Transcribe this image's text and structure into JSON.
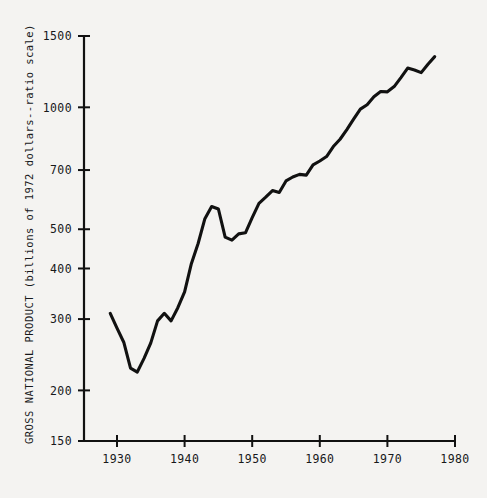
{
  "chart_data": {
    "type": "line",
    "title": "",
    "subtitle": "",
    "xlabel": "",
    "ylabel": "GROSS NATIONAL PRODUCT (billions of 1972 dollars--ratio scale)",
    "yscale": "log",
    "ylim": [
      150,
      1500
    ],
    "xlim": [
      1926,
      1981
    ],
    "grid": false,
    "legend": null,
    "yticks": [
      150,
      200,
      300,
      400,
      500,
      700,
      1000,
      1500
    ],
    "ytick_labels": [
      "150",
      "200",
      "300",
      "400",
      "500",
      "700",
      "1000",
      "1500"
    ],
    "xticks": [
      1930,
      1940,
      1950,
      1960,
      1970,
      1980
    ],
    "xtick_labels": [
      "1930",
      "1940",
      "1950",
      "1960",
      "1970",
      "1980"
    ],
    "series": [
      {
        "name": "Gross National Product",
        "color": "#111111",
        "linewidth": 3.1,
        "x": [
          1929,
          1930,
          1931,
          1932,
          1933,
          1934,
          1935,
          1936,
          1937,
          1938,
          1939,
          1940,
          1941,
          1942,
          1943,
          1944,
          1945,
          1946,
          1947,
          1948,
          1949,
          1950,
          1951,
          1952,
          1953,
          1954,
          1955,
          1956,
          1957,
          1958,
          1959,
          1960,
          1961,
          1962,
          1963,
          1964,
          1965,
          1966,
          1967,
          1968,
          1969,
          1970,
          1971,
          1972,
          1973,
          1974,
          1975,
          1976,
          1977
        ],
        "values": [
          310,
          285,
          263,
          227,
          222,
          240,
          262,
          297,
          310,
          297,
          320,
          350,
          411,
          461,
          531,
          569,
          561,
          478,
          470,
          487,
          490,
          534,
          579,
          600,
          623,
          616,
          658,
          673,
          683,
          680,
          721,
          737,
          756,
          800,
          834,
          881,
          935,
          990,
          1015,
          1062,
          1094,
          1092,
          1125,
          1184,
          1250,
          1236,
          1218,
          1278,
          1334
        ]
      }
    ],
    "annotations": []
  },
  "axis": {
    "y_title": "GROSS NATIONAL PRODUCT (billions of 1972 dollars--ratio scale)"
  },
  "colors": {
    "background": "#f4f3f1",
    "axis": "#111111",
    "line": "#111111",
    "text": "#17181a"
  }
}
